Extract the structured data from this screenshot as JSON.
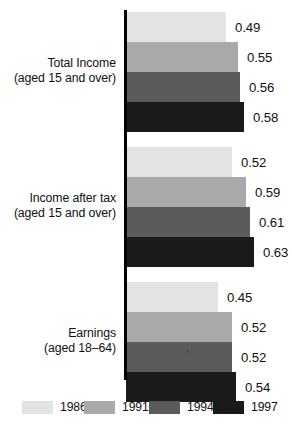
{
  "chart_data": {
    "type": "bar",
    "orientation": "horizontal",
    "title": "",
    "subtitle": "",
    "xlabel": "",
    "ylabel": "",
    "grid": false,
    "legend_position": "bottom",
    "xlim": [
      0,
      0.72
    ],
    "categories": [
      "Total Income (aged 15 and over)",
      "Income after tax (aged 15 and over)",
      "Earnings (aged 18–64)"
    ],
    "category_lines": [
      {
        "line1": "Total Income",
        "line2": "(aged 15 and over)"
      },
      {
        "line1": "Income after tax",
        "line2": "(aged 15 and over)"
      },
      {
        "line1": "Earnings",
        "line2": "(aged 18–64)"
      }
    ],
    "series": [
      {
        "name": "1986",
        "color": "#e3e3e3",
        "values": [
          0.49,
          0.52,
          0.45
        ]
      },
      {
        "name": "1991",
        "color": "#a9a9a9",
        "values": [
          0.55,
          0.59,
          0.52
        ]
      },
      {
        "name": "1994",
        "color": "#5b5b5b",
        "values": [
          0.56,
          0.61,
          0.52
        ]
      },
      {
        "name": "1997",
        "color": "#1a1a1a",
        "values": [
          0.58,
          0.63,
          0.54
        ]
      }
    ],
    "value_labels": [
      [
        "0.49",
        "0.55",
        "0.56",
        "0.58"
      ],
      [
        "0.52",
        "0.59",
        "0.61",
        "0.63"
      ],
      [
        "0.45",
        "0.52",
        "0.52",
        "0.54"
      ]
    ]
  },
  "legend": {
    "items": [
      {
        "label": "1986",
        "color": "#e3e3e3"
      },
      {
        "label": "1991",
        "color": "#a9a9a9"
      },
      {
        "label": "1994",
        "color": "#5b5b5b"
      },
      {
        "label": "1997",
        "color": "#1a1a1a"
      }
    ]
  },
  "annotations": {
    "asterisk": "*"
  }
}
